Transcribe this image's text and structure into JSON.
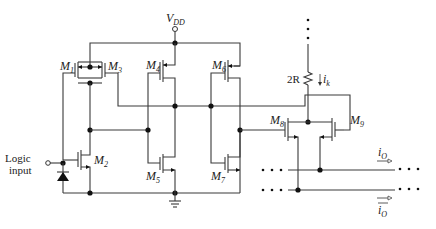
{
  "diagram": {
    "supply_label": "V",
    "supply_sub": "DD",
    "input_label_line1": "Logic",
    "input_label_line2": "input",
    "resistor_label": "2R",
    "current_label": "i",
    "current_sub": "k",
    "current_frac": "1/2",
    "output_label": "i",
    "output_sub": "O",
    "output_bar_label": "i",
    "output_bar_sub": "O",
    "transistors": [
      {
        "name": "M",
        "sub": "1"
      },
      {
        "name": "M",
        "sub": "2"
      },
      {
        "name": "M",
        "sub": "3"
      },
      {
        "name": "M",
        "sub": "4"
      },
      {
        "name": "M",
        "sub": "5"
      },
      {
        "name": "M",
        "sub": "6"
      },
      {
        "name": "M",
        "sub": "7"
      },
      {
        "name": "M",
        "sub": "8"
      },
      {
        "name": "M",
        "sub": "9"
      }
    ]
  }
}
